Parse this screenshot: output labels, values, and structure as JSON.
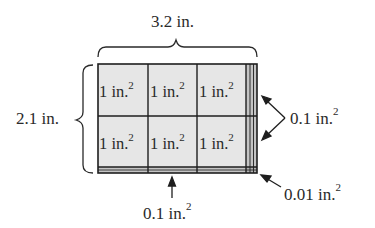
{
  "diagram": {
    "width_label": "3.2 in.",
    "height_label": "2.1 in.",
    "cells": [
      {
        "row": 0,
        "col": 0,
        "text": "1 in.",
        "exp": "2"
      },
      {
        "row": 0,
        "col": 1,
        "text": "1 in.",
        "exp": "2"
      },
      {
        "row": 0,
        "col": 2,
        "text": "1 in.",
        "exp": "2"
      },
      {
        "row": 1,
        "col": 0,
        "text": "1 in.",
        "exp": "2"
      },
      {
        "row": 1,
        "col": 1,
        "text": "1 in.",
        "exp": "2"
      },
      {
        "row": 1,
        "col": 2,
        "text": "1 in.",
        "exp": "2"
      }
    ],
    "callouts": {
      "right_strip": {
        "text": "0.1 in.",
        "exp": "2"
      },
      "bottom_strip": {
        "text": "0.1 in.",
        "exp": "2"
      },
      "corner": {
        "text": "0.01 in.",
        "exp": "2"
      }
    },
    "colors": {
      "cell_fill": "#e6e6e6",
      "strip_fill": "#b8b8b8",
      "stroke": "#1e1e1e",
      "text": "#2a2a2a"
    }
  }
}
